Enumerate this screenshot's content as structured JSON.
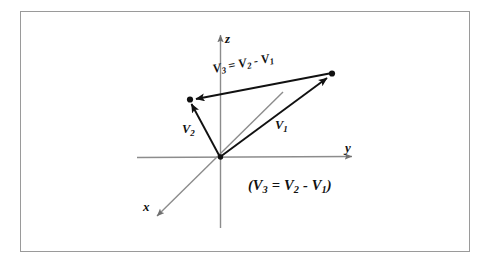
{
  "figure": {
    "background_color": "#ffffff",
    "frame_border_color": "#9a9a9a",
    "axis_color": "#8c8c8c",
    "vector_color": "#111111",
    "axes": [
      {
        "name": "x-axis",
        "label": "x",
        "label_x": 143,
        "label_y": 200
      },
      {
        "name": "y-axis",
        "label": "y",
        "label_x": 345,
        "label_y": 142
      },
      {
        "name": "z-axis",
        "label": "z",
        "label_x": 225,
        "label_y": 32
      }
    ],
    "vectors": [
      {
        "name": "V1",
        "label_base": "V",
        "label_sub": "1",
        "label_x": 275,
        "label_y": 118
      },
      {
        "name": "V2",
        "label_base": "V",
        "label_sub": "2",
        "label_x": 182,
        "label_y": 122
      },
      {
        "name": "V3",
        "label_base": "V",
        "label_sub": "3",
        "label_x": 213,
        "label_y": 63
      }
    ],
    "equation_inline": {
      "v3": "V",
      "v3_sub": "3",
      "eq": "=",
      "v2": "V",
      "v2_sub": "2",
      "minus": "-",
      "v1": "V",
      "v1_sub": "1"
    },
    "equation_paren": {
      "open": "(",
      "v3": "V",
      "v3_sub": "3",
      "eq": "=",
      "v2": "V",
      "v2_sub": "2",
      "minus": "-",
      "v1": "V",
      "v1_sub": "1",
      "close": ")",
      "x": 248,
      "y": 178
    },
    "points": [
      {
        "name": "tip-of-V1",
        "x": 332,
        "y": 74
      },
      {
        "name": "tip-of-V2",
        "x": 190,
        "y": 100
      },
      {
        "name": "origin",
        "x": 220,
        "y": 157
      }
    ]
  }
}
